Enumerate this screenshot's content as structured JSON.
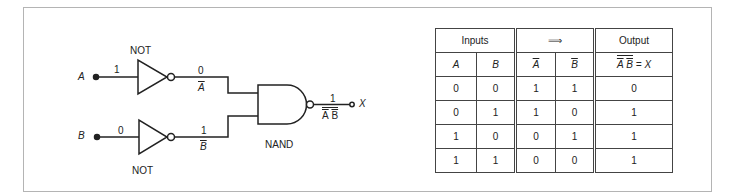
{
  "circuit": {
    "inputs": [
      {
        "name": "A",
        "value": "1"
      },
      {
        "name": "B",
        "value": "0"
      }
    ],
    "gates": [
      {
        "type": "NOT",
        "label": "NOT",
        "input": "A",
        "output_value": "0",
        "output_label": "A"
      },
      {
        "type": "NOT",
        "label": "NOT",
        "input": "B",
        "output_value": "1",
        "output_label": "B"
      },
      {
        "type": "NAND",
        "label": "NAND",
        "output_value": "1",
        "output_label_left": "A",
        "output_label_right": "B"
      }
    ],
    "output": {
      "name": "X"
    }
  },
  "truth_table": {
    "group_headers": [
      "Inputs",
      "⟹",
      "Output"
    ],
    "column_headers": [
      "A",
      "B",
      "A",
      "B"
    ],
    "output_header": {
      "left": "A",
      "right": "B",
      "eq": "= X"
    },
    "rows": [
      [
        "0",
        "0",
        "1",
        "1",
        "0"
      ],
      [
        "0",
        "1",
        "1",
        "0",
        "1"
      ],
      [
        "1",
        "0",
        "0",
        "1",
        "1"
      ],
      [
        "1",
        "1",
        "0",
        "0",
        "1"
      ]
    ]
  },
  "colors": {
    "line": "#222222",
    "frame": "#b4b4b4",
    "background": "#ffffff"
  }
}
